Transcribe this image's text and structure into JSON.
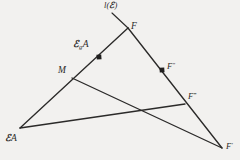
{
  "figure": {
    "kind": "euclidean-geometry-diagram",
    "width": 240,
    "height": 160,
    "background_color": "#f2f1ef",
    "stroke_color": "#2b2a29",
    "label_color": "#2b2a29"
  },
  "labels": {
    "line_l": {
      "text": "l(",
      "script": "ℰ",
      "close": ")"
    },
    "apex_F": "F",
    "point_EgA": {
      "script": "ℰ",
      "sub": "g",
      "rest": "A"
    },
    "point_M": "M",
    "point_F_double_prime": {
      "base": "F",
      "prime": "″"
    },
    "point_F_triple_prime": {
      "base": "F",
      "prime": "‴"
    },
    "point_EA": {
      "script": "ℰ",
      "rest": "A"
    },
    "point_F_prime": {
      "base": "F",
      "prime": "′"
    }
  },
  "geometry": {
    "vertices": {
      "F": {
        "x": 128,
        "y": 28,
        "label": "F"
      },
      "M": {
        "x": 72,
        "y": 78,
        "label": "M"
      },
      "EA": {
        "x": 20,
        "y": 128,
        "label": "ℰA"
      },
      "F1": {
        "x": 222,
        "y": 148,
        "label": "F′"
      },
      "F3": {
        "x": 185,
        "y": 104,
        "label": "F‴"
      }
    },
    "marked_points": [
      {
        "name": "EgA",
        "x": 99,
        "y": 57,
        "marker": "filled-square",
        "size": 4
      },
      {
        "name": "F2",
        "x": 162,
        "y": 70,
        "marker": "filled-square",
        "size": 4
      }
    ],
    "line_l_extension": {
      "x1": 112,
      "y1": 13,
      "x2": 128,
      "y2": 28
    },
    "segments": [
      {
        "name": "left-edge-F-to-EA",
        "x1": 128,
        "y1": 28,
        "x2": 20,
        "y2": 128
      },
      {
        "name": "right-edge-F-to-Fp",
        "x1": 128,
        "y1": 28,
        "x2": 222,
        "y2": 148
      },
      {
        "name": "transversal-M-to-Fp",
        "x1": 72,
        "y1": 78,
        "x2": 222,
        "y2": 148
      },
      {
        "name": "base-EA-to-F3",
        "x1": 20,
        "y1": 128,
        "x2": 185,
        "y2": 104
      }
    ],
    "intersection_points": [
      {
        "name": "base-crosses-transversal",
        "x": 152,
        "y": 111
      },
      {
        "name": "base-crosses-right-edge",
        "x": 185,
        "y": 104
      }
    ]
  }
}
